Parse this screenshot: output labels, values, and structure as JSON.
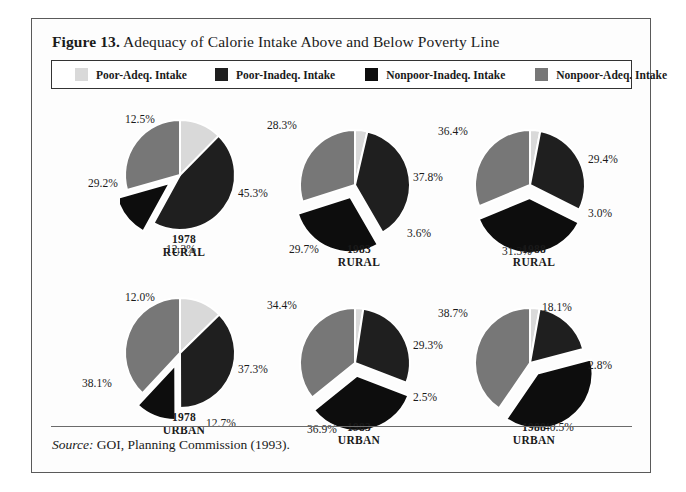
{
  "figure": {
    "number_label": "Figure 13.",
    "title": "Adequacy of Calorie Intake Above and Below Poverty Line",
    "source_keyword": "Source:",
    "source_text": "GOI, Planning Commission (1993)."
  },
  "legend": {
    "items": [
      {
        "label": "Poor-Adeq. Intake",
        "color": "#d9d9d9",
        "key": "poor_adeq"
      },
      {
        "label": "Poor-Inadeq. Intake",
        "color": "#1f1f1f",
        "key": "poor_inadeq"
      },
      {
        "label": "Nonpoor-Inadeq. Intake",
        "color": "#0d0d0d",
        "key": "nonpoor_inadeq"
      },
      {
        "label": "Nonpoor-Adeq. Intake",
        "color": "#777777",
        "key": "nonpoor_adeq"
      }
    ]
  },
  "chart_data": {
    "type": "pie",
    "title": "Adequacy of Calorie Intake Above and Below Poverty Line",
    "legend_position": "top",
    "categories": [
      "Poor-Adeq. Intake",
      "Poor-Inadeq. Intake",
      "Nonpoor-Inadeq. Intake",
      "Nonpoor-Adeq. Intake"
    ],
    "colors": [
      "#d9d9d9",
      "#1f1f1f",
      "#0d0d0d",
      "#777777"
    ],
    "units": "percent",
    "panels": [
      {
        "year": "1978",
        "sector": "RURAL",
        "values": [
          12.3,
          45.3,
          12.5,
          29.2
        ],
        "labels": [
          "12.3%",
          "45.3%",
          "12.5%",
          "29.2%"
        ]
      },
      {
        "year": "1983",
        "sector": "RURAL",
        "values": [
          3.6,
          37.8,
          28.3,
          29.7
        ],
        "labels": [
          "3.6%",
          "37.8%",
          "28.3%",
          "29.7%"
        ]
      },
      {
        "year": "1988",
        "sector": "RURAL",
        "values": [
          3.0,
          29.4,
          36.4,
          31.3
        ],
        "labels": [
          "3.0%",
          "29.4%",
          "36.4%",
          "31.3%"
        ]
      },
      {
        "year": "1978",
        "sector": "URBAN",
        "values": [
          12.7,
          37.3,
          12.0,
          38.1
        ],
        "labels": [
          "12.7%",
          "37.3%",
          "12.0%",
          "38.1%"
        ]
      },
      {
        "year": "1983",
        "sector": "URBAN",
        "values": [
          2.5,
          29.3,
          34.4,
          36.9
        ],
        "labels": [
          "2.5%",
          "29.3%",
          "34.4%",
          "36.9%"
        ]
      },
      {
        "year": "1988",
        "sector": "URBAN",
        "values": [
          2.8,
          18.1,
          38.7,
          40.5
        ],
        "labels": [
          "2.8%",
          "18.1%",
          "38.7%",
          "40.5%"
        ]
      }
    ]
  },
  "panel_layout": [
    {
      "id": "p1",
      "left": 88,
      "top": 22,
      "caption_top": 140,
      "exploded_index": 2,
      "labels_xy": [
        [
          46,
          128
        ],
        [
          118,
          72
        ],
        [
          5,
          -2
        ],
        [
          -32,
          62
        ]
      ]
    },
    {
      "id": "p2",
      "left": 263,
      "top": 32,
      "caption_top": 150,
      "exploded_index": 2,
      "labels_xy": [
        [
          112,
          102
        ],
        [
          118,
          46
        ],
        [
          -28,
          -6
        ],
        [
          -6,
          118
        ]
      ]
    },
    {
      "id": "p3",
      "left": 438,
      "top": 32,
      "caption_top": 150,
      "exploded_index": 2,
      "labels_xy": [
        [
          118,
          82
        ],
        [
          118,
          28
        ],
        [
          -32,
          0
        ],
        [
          32,
          120
        ]
      ]
    },
    {
      "id": "p4",
      "left": 88,
      "top": 200,
      "caption_top": 318,
      "exploded_index": 2,
      "labels_xy": [
        [
          86,
          124
        ],
        [
          118,
          70
        ],
        [
          5,
          -2
        ],
        [
          -38,
          84
        ]
      ]
    },
    {
      "id": "p5",
      "left": 263,
      "top": 210,
      "caption_top": 328,
      "exploded_index": 2,
      "labels_xy": [
        [
          118,
          88
        ],
        [
          118,
          36
        ],
        [
          -28,
          -4
        ],
        [
          12,
          120
        ]
      ]
    },
    {
      "id": "p6",
      "left": 438,
      "top": 210,
      "caption_top": 328,
      "exploded_index": 2,
      "labels_xy": [
        [
          118,
          56
        ],
        [
          72,
          -2
        ],
        [
          -32,
          4
        ],
        [
          74,
          118
        ]
      ]
    }
  ]
}
